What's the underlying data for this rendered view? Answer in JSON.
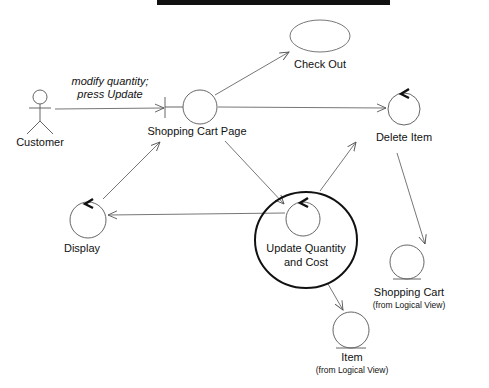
{
  "header": {
    "bar_color": "#111111"
  },
  "diagram": {
    "type": "UML collaboration / robustness diagram",
    "actor": {
      "label": "Customer"
    },
    "message": {
      "line1": "modify quantity;",
      "line2": "press Update"
    },
    "nodes": {
      "check_out": {
        "label": "Check Out",
        "kind": "use-case"
      },
      "shopping_cart_page": {
        "label": "Shopping Cart Page",
        "kind": "boundary"
      },
      "delete_item": {
        "label": "Delete Item",
        "kind": "control"
      },
      "display": {
        "label": "Display",
        "kind": "control"
      },
      "update_quantity": {
        "line1": "Update Quantity",
        "line2": "and Cost",
        "kind": "control",
        "highlighted": true
      },
      "shopping_cart": {
        "label": "Shopping Cart",
        "sub": "(from Logical View)",
        "kind": "entity"
      },
      "item": {
        "label": "Item",
        "sub": "(from Logical View)",
        "kind": "entity"
      }
    },
    "edges": [
      {
        "from": "Customer",
        "to": "Shopping Cart Page"
      },
      {
        "from": "Shopping Cart Page",
        "to": "Check Out"
      },
      {
        "from": "Shopping Cart Page",
        "to": "Delete Item"
      },
      {
        "from": "Shopping Cart Page",
        "to": "Update Quantity and Cost"
      },
      {
        "from": "Display",
        "to": "Shopping Cart Page"
      },
      {
        "from": "Update Quantity and Cost",
        "to": "Display"
      },
      {
        "from": "Update Quantity and Cost",
        "to": "Delete Item"
      },
      {
        "from": "Update Quantity and Cost",
        "to": "Item"
      },
      {
        "from": "Delete Item",
        "to": "Shopping Cart"
      }
    ]
  }
}
